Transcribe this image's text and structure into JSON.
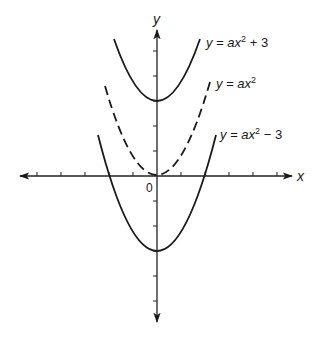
{
  "figure": {
    "axes": {
      "x_label": "x",
      "y_label": "y",
      "origin_label": "0",
      "x_ticks": [
        -5,
        -4,
        -3,
        -2,
        -1,
        1,
        2,
        3,
        4,
        5
      ],
      "y_ticks": [
        -5,
        -4,
        -3,
        -2,
        -1,
        1,
        2,
        3,
        4,
        5
      ]
    },
    "curves": [
      {
        "name": "upper",
        "label_prefix": "y = ax",
        "label_exp": "2",
        "label_suffix": " + 3",
        "shift": 3,
        "style": "solid"
      },
      {
        "name": "middle",
        "label_prefix": "y = ax",
        "label_exp": "2",
        "label_suffix": "",
        "shift": 0,
        "style": "dashed"
      },
      {
        "name": "lower",
        "label_prefix": "y = ax",
        "label_exp": "2",
        "label_suffix": " − 3",
        "shift": -3,
        "style": "solid"
      }
    ],
    "colors": {
      "ink": "#1a1a1a",
      "background": "#ffffff"
    }
  }
}
